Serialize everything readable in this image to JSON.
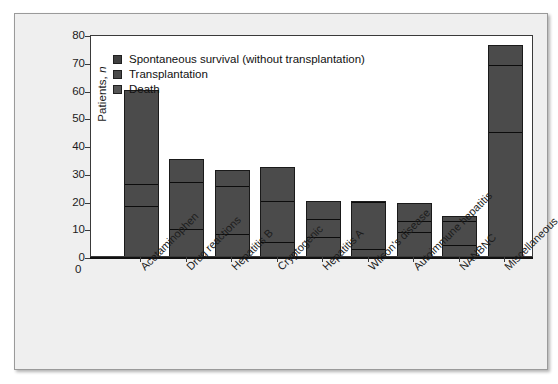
{
  "chart_data": {
    "type": "bar",
    "subtype": "stacked-vertical",
    "title": "",
    "xlabel": "",
    "ylabel": "Patients, n",
    "ylim": [
      0,
      80
    ],
    "yticks": [
      0,
      10,
      20,
      30,
      40,
      50,
      60,
      70,
      80
    ],
    "grid": false,
    "legend_position": "top-left",
    "xtick_rotation": -45,
    "categories": [
      "Acetaminophen",
      "Drug reactions",
      "Hepatitis B",
      "Cryptogenic",
      "Hepatitis A",
      "Wilson's disease",
      "Autoimmune hepatitis",
      "NANBNC",
      "Miscellaneous"
    ],
    "series": [
      {
        "name": "Death",
        "color": "#4b4b4b",
        "values": [
          18,
          10,
          8,
          5,
          7,
          2.5,
          9,
          4,
          45
        ]
      },
      {
        "name": "Transplantation",
        "color": "#4b4b4b",
        "values": [
          8,
          17,
          17.5,
          15,
          6.5,
          17.5,
          4,
          9,
          24
        ]
      },
      {
        "name": "Spontaneous survival (without transplantation)",
        "color": "#4b4b4b",
        "values": [
          34,
          8,
          5.5,
          12,
          6.5,
          0,
          6,
          1.5,
          7
        ]
      }
    ],
    "totals": [
      60,
      35,
      31,
      32,
      20,
      20,
      19,
      14.5,
      76
    ]
  },
  "legend": {
    "items": [
      {
        "label": "Spontaneous survival (without transplantation)",
        "color": "#404040"
      },
      {
        "label": "Transplantation",
        "color": "#4a4a4a"
      },
      {
        "label": "Death",
        "color": "#555555"
      }
    ]
  },
  "axis": {
    "y_title_main": "Patients,",
    "y_title_italic": "n",
    "x_origin_label": "0"
  },
  "colors": {
    "bar_fill": "#4b4b4b",
    "bar_stroke": "#1a1a1a",
    "segment_divider": "#0c0c0c",
    "panel_background": "#ffffff",
    "figure_background": "#efefef",
    "axis_line": "#3a3a3a",
    "text": "#1c1c1c"
  }
}
